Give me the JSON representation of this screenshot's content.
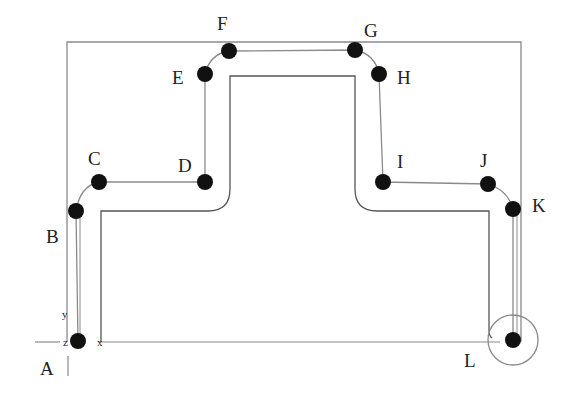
{
  "diagram": {
    "type": "cnc-toolpath-contour",
    "colors": {
      "line": "#8a8a8a",
      "profile": "#555555",
      "point": "#111111",
      "text": "#222222",
      "background": "#ffffff"
    },
    "stock_rect": {
      "x": 67,
      "y": 42,
      "w": 454,
      "h": 300
    },
    "axes": {
      "origin": {
        "x": 78,
        "y": 342
      },
      "x_label": "x",
      "y_label": "y",
      "z_label": "z"
    },
    "points": [
      {
        "id": "A",
        "label": "A",
        "x": 78,
        "y": 341,
        "lx": 40,
        "ly": 375
      },
      {
        "id": "B",
        "label": "B",
        "x": 76,
        "y": 211,
        "lx": 46,
        "ly": 243
      },
      {
        "id": "C",
        "label": "C",
        "x": 99,
        "y": 182,
        "lx": 88,
        "ly": 165
      },
      {
        "id": "D",
        "label": "D",
        "x": 205,
        "y": 182,
        "lx": 178,
        "ly": 172
      },
      {
        "id": "E",
        "label": "E",
        "x": 205,
        "y": 74,
        "lx": 172,
        "ly": 84
      },
      {
        "id": "F",
        "label": "F",
        "x": 229,
        "y": 51,
        "lx": 217,
        "ly": 30
      },
      {
        "id": "G",
        "label": "G",
        "x": 355,
        "y": 50,
        "lx": 364,
        "ly": 37
      },
      {
        "id": "H",
        "label": "H",
        "x": 379,
        "y": 74,
        "lx": 397,
        "ly": 84
      },
      {
        "id": "I",
        "label": "I",
        "x": 383,
        "y": 182,
        "lx": 397,
        "ly": 168
      },
      {
        "id": "J",
        "label": "J",
        "x": 488,
        "y": 184,
        "lx": 480,
        "ly": 167
      },
      {
        "id": "K",
        "label": "K",
        "x": 513,
        "y": 209,
        "lx": 532,
        "ly": 212
      },
      {
        "id": "L",
        "label": "L",
        "x": 513,
        "y": 340,
        "lx": 464,
        "ly": 367
      }
    ],
    "end_circle": {
      "cx": 513,
      "cy": 340,
      "r": 25
    }
  }
}
